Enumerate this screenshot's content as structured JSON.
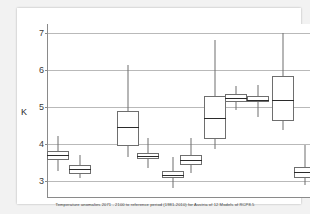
{
  "chart_data": {
    "type": "box",
    "title": "",
    "caption": "Temperature anomalies 2071 - 2100 to reference period (1981-2010) for Austria of 12 Models of RCP8.5",
    "xlabel": "",
    "ylabel": "K",
    "ylim": [
      2.55,
      7.25
    ],
    "yticks": [
      3,
      4,
      5,
      6,
      7
    ],
    "ytick_labels": [
      "3",
      "4",
      "5",
      "6",
      "7"
    ],
    "grid": true,
    "legend": "none",
    "categories": [
      "1",
      "2",
      "3",
      "4",
      "5",
      "6",
      "7",
      "8",
      "9",
      "10",
      "11",
      "12"
    ],
    "boxes": [
      {
        "name": "model-1",
        "whisker_low": 3.28,
        "q1": 3.58,
        "median": 3.72,
        "q3": 3.83,
        "whisker_high": 4.23
      },
      {
        "name": "model-2",
        "whisker_low": 3.08,
        "q1": 3.2,
        "median": 3.32,
        "q3": 3.45,
        "whisker_high": 3.7
      },
      {
        "name": "model-3",
        "whisker_low": 3.65,
        "q1": 3.95,
        "median": 4.47,
        "q3": 4.9,
        "whisker_high": 6.15
      },
      {
        "name": "model-4",
        "whisker_low": 3.35,
        "q1": 3.6,
        "median": 3.68,
        "q3": 3.76,
        "whisker_high": 4.17
      },
      {
        "name": "model-5",
        "whisker_low": 2.82,
        "q1": 3.1,
        "median": 3.18,
        "q3": 3.28,
        "whisker_high": 3.65
      },
      {
        "name": "model-6",
        "whisker_low": 3.22,
        "q1": 3.45,
        "median": 3.57,
        "q3": 3.7,
        "whisker_high": 4.18
      },
      {
        "name": "model-7",
        "whisker_low": 3.88,
        "q1": 4.15,
        "median": 4.7,
        "q3": 5.3,
        "whisker_high": 6.82
      },
      {
        "name": "model-8",
        "whisker_low": 4.93,
        "q1": 5.14,
        "median": 5.24,
        "q3": 5.35,
        "whisker_high": 5.58
      },
      {
        "name": "model-9",
        "whisker_low": 4.75,
        "q1": 5.13,
        "median": 5.21,
        "q3": 5.3,
        "whisker_high": 5.6
      },
      {
        "name": "model-10",
        "whisker_low": 4.38,
        "q1": 4.62,
        "median": 5.2,
        "q3": 5.85,
        "whisker_high": 7.0
      },
      {
        "name": "model-11",
        "whisker_low": 2.9,
        "q1": 3.08,
        "median": 3.25,
        "q3": 3.38,
        "whisker_high": 3.98
      },
      {
        "name": "model-12",
        "whisker_low": 3.48,
        "q1": 3.67,
        "median": 4.15,
        "q3": 4.48,
        "whisker_high": 5.4
      }
    ],
    "box_x_centers_px": [
      40,
      62,
      110,
      130,
      155,
      173,
      197,
      218,
      240,
      265,
      287,
      303
    ],
    "colors": {
      "figure_background": "#f2f2f2",
      "panel_background": "#ffffff",
      "gridline": "#b9b9b9",
      "axis": "#8a8a8a",
      "box_outline": "#6e6e6e",
      "median": "#2b2b2b",
      "text": "#3a3a3a"
    }
  }
}
